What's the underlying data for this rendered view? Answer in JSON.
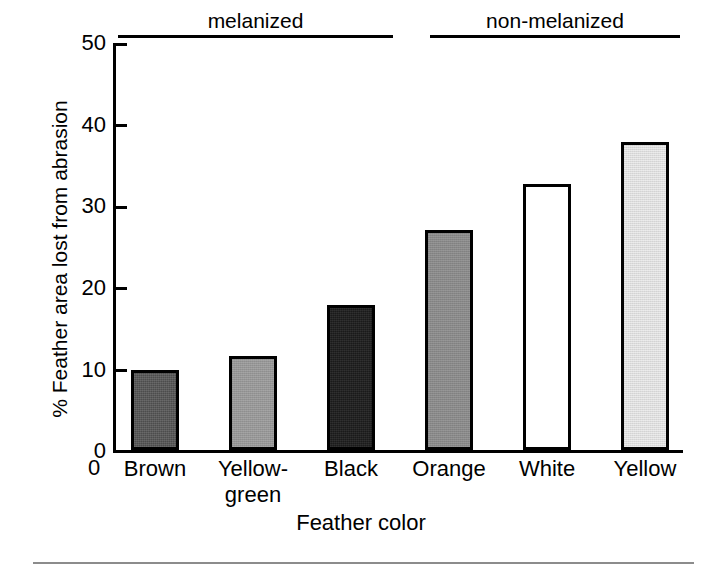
{
  "chart_data": {
    "type": "bar",
    "title": "",
    "subtitle": "",
    "xlabel": "Feather color",
    "ylabel": "% Feather area lost from abrasion",
    "categories": [
      "Brown",
      "Yellow-\ngreen",
      "Black",
      "Orange",
      "White",
      "Yellow"
    ],
    "category_labels": [
      {
        "line1": "Brown",
        "line2": ""
      },
      {
        "line1": "Yellow-",
        "line2": "green"
      },
      {
        "line1": "Black",
        "line2": ""
      },
      {
        "line1": "Orange",
        "line2": ""
      },
      {
        "line1": "White",
        "line2": ""
      },
      {
        "line1": "Yellow",
        "line2": ""
      }
    ],
    "values": [
      9.8,
      11.5,
      17.8,
      27.0,
      32.7,
      37.8
    ],
    "bar_fills": [
      "dark-gray-dither",
      "medium-gray-dither",
      "black-dither",
      "gray-dither",
      "white-unfilled",
      "light-gray-dither"
    ],
    "bar_fill_colors": [
      "#4c4c4c",
      "#969696",
      "#1a1a1a",
      "#888888",
      "#ffffff",
      "#dcdcdc"
    ],
    "bar_edge_color": "#000000",
    "ylim": [
      0,
      50
    ],
    "yticks": [
      0,
      10,
      20,
      30,
      40,
      50
    ],
    "ytick_labels": [
      "0",
      "10",
      "20",
      "30",
      "40",
      "50"
    ],
    "x_origin_label": "0",
    "grid": false,
    "legend": "none",
    "annotations": [
      {
        "label": "melanized",
        "covers": [
          "Brown",
          "Yellow-green",
          "Black"
        ]
      },
      {
        "label": "non-melanized",
        "covers": [
          "Orange",
          "White",
          "Yellow"
        ]
      }
    ]
  },
  "axes": {
    "y_title": "% Feather area lost from abrasion",
    "x_title": "Feather color",
    "origin_label": "0"
  },
  "groups": [
    {
      "label": "melanized"
    },
    {
      "label": "non-melanized"
    }
  ],
  "ticks": {
    "y": [
      "50",
      "40",
      "30",
      "20",
      "10",
      "0"
    ]
  },
  "bars": [
    {
      "label_line1": "Brown",
      "label_line2": "",
      "value": 9.8
    },
    {
      "label_line1": "Yellow-",
      "label_line2": "green",
      "value": 11.5
    },
    {
      "label_line1": "Black",
      "label_line2": "",
      "value": 17.8
    },
    {
      "label_line1": "Orange",
      "label_line2": "",
      "value": 27.0
    },
    {
      "label_line1": "White",
      "label_line2": "",
      "value": 32.7
    },
    {
      "label_line1": "Yellow",
      "label_line2": "",
      "value": 37.8
    }
  ]
}
